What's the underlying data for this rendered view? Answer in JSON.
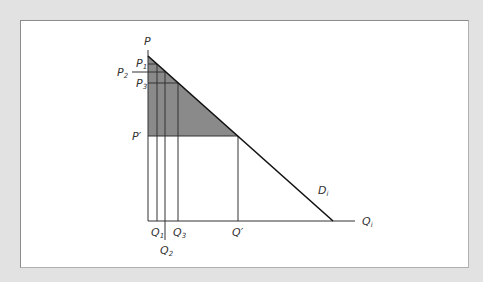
{
  "diagram": {
    "title": "",
    "colors": {
      "background": "#e2e2e2",
      "panel": "#ffffff",
      "shade": "#8a8a8a",
      "lines": "#222222",
      "text": "#333333"
    },
    "axes": {
      "y_label": "P",
      "x_label": "Q",
      "x_label_sub": "i"
    },
    "demand": {
      "label": "D",
      "label_sub": "i"
    },
    "price_labels": [
      {
        "name": "P",
        "sub": "1"
      },
      {
        "name": "P",
        "sub": "2"
      },
      {
        "name": "P",
        "sub": "3"
      },
      {
        "name": "P′",
        "sub": ""
      }
    ],
    "quantity_labels": [
      {
        "name": "Q",
        "sub": "1"
      },
      {
        "name": "Q",
        "sub": "2"
      },
      {
        "name": "Q",
        "sub": "3"
      },
      {
        "name": "Q′",
        "sub": ""
      }
    ],
    "shaded_region": "area under demand curve above P′ (consumer surplus region)"
  }
}
